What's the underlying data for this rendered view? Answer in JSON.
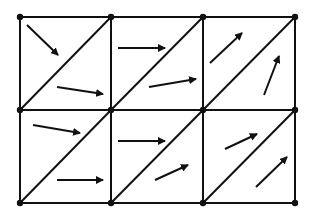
{
  "diagram": {
    "title": "",
    "type": "triangulated mesh with vector field",
    "colors": {
      "background": "#ffffff",
      "stroke": "#111111"
    },
    "grid": {
      "x_nodes": [
        20,
        111,
        203,
        295
      ],
      "y_nodes": [
        17,
        110,
        203
      ],
      "columns": 3,
      "rows": 2,
      "diagonal": "bottom-left to top-right"
    },
    "arrows": [
      {
        "cell": "r0c0-upper",
        "x1": 27,
        "y1": 25,
        "x2": 58,
        "y2": 55
      },
      {
        "cell": "r0c0-lower",
        "x1": 57,
        "y1": 87,
        "x2": 103,
        "y2": 94
      },
      {
        "cell": "r0c1-upper",
        "x1": 118,
        "y1": 48,
        "x2": 165,
        "y2": 48
      },
      {
        "cell": "r0c1-lower",
        "x1": 149,
        "y1": 87,
        "x2": 196,
        "y2": 79
      },
      {
        "cell": "r0c2-upper",
        "x1": 210,
        "y1": 63,
        "x2": 242,
        "y2": 33
      },
      {
        "cell": "r0c2-lower",
        "x1": 264,
        "y1": 95,
        "x2": 279,
        "y2": 56
      },
      {
        "cell": "r1c0-upper",
        "x1": 33,
        "y1": 125,
        "x2": 80,
        "y2": 133
      },
      {
        "cell": "r1c0-lower",
        "x1": 57,
        "y1": 180,
        "x2": 103,
        "y2": 180
      },
      {
        "cell": "r1c1-upper",
        "x1": 118,
        "y1": 141,
        "x2": 165,
        "y2": 141
      },
      {
        "cell": "r1c1-lower",
        "x1": 155,
        "y1": 180,
        "x2": 188,
        "y2": 165
      },
      {
        "cell": "r1c2-upper",
        "x1": 225,
        "y1": 149,
        "x2": 257,
        "y2": 134
      },
      {
        "cell": "r1c2-lower",
        "x1": 256,
        "y1": 187,
        "x2": 287,
        "y2": 157
      }
    ]
  }
}
